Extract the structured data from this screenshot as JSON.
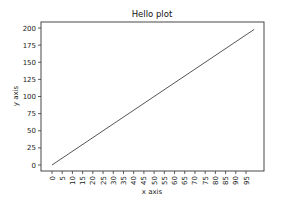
{
  "chart_data": {
    "type": "line",
    "title": "Hello plot",
    "xlabel": "x axis",
    "ylabel": "y axis",
    "xlim": [
      -5,
      104
    ],
    "ylim": [
      -10,
      208
    ],
    "grid": false,
    "legend": null,
    "x_ticks": [
      0,
      5,
      10,
      15,
      20,
      25,
      30,
      35,
      40,
      45,
      50,
      55,
      60,
      65,
      70,
      75,
      80,
      85,
      90,
      95
    ],
    "y_ticks": [
      0,
      25,
      50,
      75,
      100,
      125,
      150,
      175,
      200
    ],
    "series": [
      {
        "name": "y = 2x",
        "color": "#555555",
        "x": [
          0,
          99
        ],
        "y": [
          0,
          198
        ]
      }
    ]
  },
  "layout": {
    "frame": {
      "left": 41,
      "top": 22,
      "right": 264,
      "bottom": 171
    },
    "x_pixel": {
      "v0": 0,
      "p0": 52,
      "v1": 95,
      "p1": 246
    },
    "y_pixel": {
      "v0": 0,
      "p0": 165,
      "v1": 200,
      "p1": 28
    }
  }
}
